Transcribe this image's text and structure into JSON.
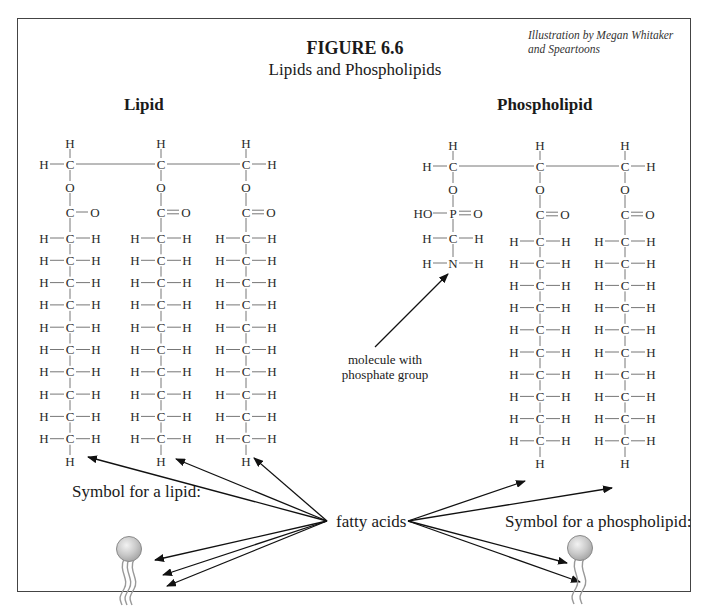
{
  "figure": {
    "number": "FIGURE 6.6",
    "title": "Lipids and Phospholipids",
    "credit": "Illustration by Megan Whitaker and Speartoons"
  },
  "lipid": {
    "heading": "Lipid",
    "symbol_label": "Symbol for a lipid:",
    "columns": [
      {
        "x": 70,
        "top": "H",
        "left_sub": "H",
        "right_sub": "",
        "linker": "O",
        "carbonyl": "C—O",
        "chain_rows": 10,
        "end": "H"
      },
      {
        "x": 161,
        "top": "H",
        "left_sub": "",
        "right_sub": "",
        "linker": "O",
        "carbonyl": "C═O",
        "chain_rows": 10,
        "end": "H"
      },
      {
        "x": 246,
        "top": "H",
        "left_sub": "",
        "right_sub": "H",
        "linker": "O",
        "carbonyl": "C═O",
        "chain_rows": 10,
        "end": "H"
      }
    ],
    "chain_row": {
      "left": "H",
      "center": "C",
      "right": "H"
    }
  },
  "phospholipid": {
    "heading": "Phospholipid",
    "symbol_label": "Symbol for a phospholipid:",
    "head_group": {
      "phosphate": {
        "left": "HO",
        "center": "P",
        "right": "O"
      },
      "methylene": {
        "left": "H",
        "center": "C",
        "right": "H"
      },
      "amine": {
        "left": "H",
        "center": "N",
        "right": "H"
      }
    },
    "columns": [
      {
        "x": 453,
        "top": "H",
        "left_sub": "H",
        "right_sub": "",
        "linker": "O"
      },
      {
        "x": 540,
        "top": "H",
        "left_sub": "",
        "right_sub": "",
        "linker": "O",
        "carbonyl": "C═O",
        "chain_rows": 10,
        "end": "H"
      },
      {
        "x": 625,
        "top": "H",
        "left_sub": "",
        "right_sub": "H",
        "linker": "O",
        "carbonyl": "C═O",
        "chain_rows": 10,
        "end": "H"
      }
    ]
  },
  "annotations": {
    "fatty_acids": "fatty acids",
    "phosphate_molecule_line1": "molecule with",
    "phosphate_molecule_line2": "phosphate group"
  },
  "colors": {
    "ink": "#2a2a2a",
    "frame": "#444444",
    "bond": "#777777",
    "head_fill": "#c8c8c8",
    "head_stroke": "#8a8a8a"
  }
}
